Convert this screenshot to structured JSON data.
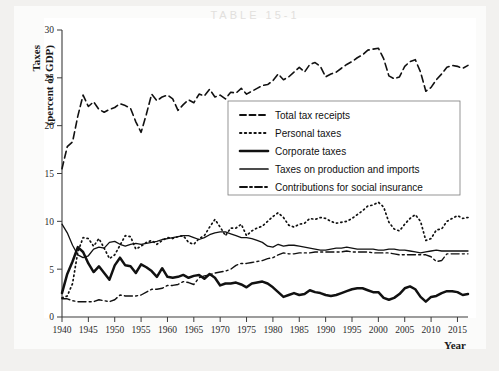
{
  "page": {
    "ghost_header": "TABLE 15-1"
  },
  "chart_data": {
    "type": "line",
    "title": "",
    "xlabel": "Year",
    "ylabel": "Taxes (percent of GDP)",
    "ylabel_line1": "Taxes",
    "ylabel_line2": "(percent of GDP)",
    "xlim": [
      1940,
      2017
    ],
    "ylim": [
      0,
      30
    ],
    "yticks": [
      0,
      5,
      10,
      15,
      20,
      25,
      30
    ],
    "ytick_labels": [
      "0",
      "5",
      "10",
      "15",
      "20",
      "25",
      "30"
    ],
    "xticks": [
      1940,
      1945,
      1950,
      1955,
      1960,
      1965,
      1970,
      1975,
      1980,
      1985,
      1990,
      1995,
      2000,
      2005,
      2010,
      2015
    ],
    "xtick_labels": [
      "1940",
      "1945",
      "1950",
      "1955",
      "1960",
      "1965",
      "1970",
      "1975",
      "1980",
      "1985",
      "1990",
      "1995",
      "2000",
      "2005",
      "2010",
      "2015"
    ],
    "grid": false,
    "legend_position": "center",
    "x": [
      1940,
      1941,
      1942,
      1943,
      1944,
      1945,
      1946,
      1947,
      1948,
      1949,
      1950,
      1951,
      1952,
      1953,
      1954,
      1955,
      1956,
      1957,
      1958,
      1959,
      1960,
      1961,
      1962,
      1963,
      1964,
      1965,
      1966,
      1967,
      1968,
      1969,
      1970,
      1971,
      1972,
      1973,
      1974,
      1975,
      1976,
      1977,
      1978,
      1979,
      1980,
      1981,
      1982,
      1983,
      1984,
      1985,
      1986,
      1987,
      1988,
      1989,
      1990,
      1991,
      1992,
      1993,
      1994,
      1995,
      1996,
      1997,
      1998,
      1999,
      2000,
      2001,
      2002,
      2003,
      2004,
      2005,
      2006,
      2007,
      2008,
      2009,
      2010,
      2011,
      2012,
      2013,
      2014,
      2015,
      2016,
      2017
    ],
    "series": [
      {
        "name": "Total tax receipts",
        "style": "dashed",
        "linewidth": 1.6,
        "color": "#111111",
        "values": [
          15.5,
          17.8,
          18.3,
          21.0,
          23.2,
          22.0,
          22.5,
          21.7,
          21.4,
          21.7,
          21.9,
          22.3,
          22.1,
          21.8,
          20.4,
          19.3,
          21.2,
          23.3,
          22.6,
          23.0,
          23.2,
          22.8,
          21.6,
          22.2,
          22.7,
          22.4,
          23.3,
          23.1,
          23.8,
          23.0,
          23.2,
          22.8,
          23.5,
          23.4,
          23.9,
          23.3,
          23.6,
          23.9,
          24.2,
          24.3,
          24.7,
          25.4,
          24.8,
          25.1,
          25.6,
          26.1,
          25.6,
          26.4,
          26.6,
          26.2,
          25.1,
          25.4,
          25.6,
          26.0,
          26.4,
          26.7,
          27.1,
          27.4,
          27.9,
          28.0,
          28.1,
          27.0,
          25.2,
          24.9,
          25.1,
          26.2,
          26.7,
          26.9,
          25.6,
          23.6,
          24.0,
          24.8,
          25.4,
          26.1,
          26.3,
          26.2,
          26.0,
          26.3
        ]
      },
      {
        "name": "Personal taxes",
        "style": "dotted",
        "linewidth": 1.7,
        "color": "#111111",
        "values": [
          2.0,
          2.2,
          3.5,
          6.8,
          8.3,
          8.2,
          7.4,
          8.2,
          7.2,
          6.1,
          6.5,
          7.5,
          8.5,
          8.4,
          7.1,
          7.4,
          7.8,
          8.0,
          7.6,
          8.0,
          8.3,
          8.2,
          8.4,
          8.5,
          7.8,
          7.6,
          8.2,
          8.5,
          9.4,
          10.2,
          9.4,
          8.5,
          9.3,
          9.3,
          9.7,
          8.5,
          9.0,
          9.3,
          9.5,
          10.0,
          10.5,
          10.9,
          10.4,
          9.6,
          9.4,
          9.7,
          9.8,
          10.3,
          10.2,
          10.4,
          10.3,
          10.0,
          9.8,
          9.9,
          10.0,
          10.3,
          10.7,
          11.1,
          11.6,
          11.7,
          12.0,
          11.5,
          9.9,
          9.2,
          9.0,
          9.7,
          10.3,
          10.7,
          10.0,
          8.0,
          8.2,
          9.1,
          9.2,
          10.0,
          10.3,
          10.6,
          10.3,
          10.4
        ]
      },
      {
        "name": "Corporate taxes",
        "style": "solid",
        "linewidth": 2.5,
        "color": "#111111",
        "values": [
          2.5,
          4.5,
          5.8,
          7.3,
          6.8,
          5.6,
          4.7,
          5.3,
          4.6,
          3.9,
          5.4,
          6.2,
          5.4,
          5.3,
          4.6,
          5.5,
          5.2,
          4.8,
          4.2,
          5.1,
          4.2,
          4.1,
          4.2,
          4.4,
          4.1,
          4.3,
          4.4,
          4.0,
          4.5,
          4.1,
          3.3,
          3.5,
          3.5,
          3.6,
          3.4,
          3.1,
          3.5,
          3.6,
          3.7,
          3.5,
          3.1,
          2.6,
          2.1,
          2.3,
          2.5,
          2.3,
          2.4,
          2.8,
          2.6,
          2.5,
          2.3,
          2.2,
          2.3,
          2.5,
          2.7,
          2.9,
          3.0,
          3.0,
          2.8,
          2.6,
          2.6,
          2.0,
          1.8,
          2.0,
          2.4,
          3.0,
          3.2,
          2.9,
          2.1,
          1.6,
          2.1,
          2.2,
          2.5,
          2.7,
          2.7,
          2.6,
          2.3,
          2.4
        ]
      },
      {
        "name": "Taxes on production and imports",
        "style": "solid",
        "linewidth": 1.3,
        "color": "#111111",
        "values": [
          9.7,
          8.8,
          7.5,
          6.5,
          6.2,
          6.4,
          7.1,
          7.3,
          7.2,
          7.8,
          7.9,
          7.6,
          7.4,
          7.6,
          7.7,
          7.6,
          7.7,
          7.8,
          7.9,
          8.1,
          8.2,
          8.3,
          8.4,
          8.5,
          8.5,
          8.3,
          8.1,
          8.3,
          8.6,
          8.8,
          8.9,
          8.9,
          8.7,
          8.5,
          8.3,
          8.3,
          8.2,
          8.0,
          7.8,
          7.4,
          7.3,
          7.6,
          7.4,
          7.5,
          7.5,
          7.4,
          7.3,
          7.2,
          7.1,
          7.0,
          7.0,
          7.1,
          7.2,
          7.2,
          7.3,
          7.2,
          7.1,
          7.1,
          7.1,
          7.1,
          7.0,
          7.0,
          7.1,
          7.1,
          7.0,
          7.0,
          6.9,
          6.8,
          6.7,
          6.8,
          6.9,
          7.0,
          6.9,
          6.9,
          6.9,
          6.9,
          6.9,
          6.9
        ]
      },
      {
        "name": "Contributions for social insurance",
        "style": "dashdot",
        "linewidth": 1.4,
        "color": "#111111",
        "values": [
          1.9,
          1.9,
          1.7,
          1.6,
          1.6,
          1.6,
          1.6,
          1.8,
          1.7,
          1.6,
          1.8,
          2.3,
          2.2,
          2.2,
          2.2,
          2.3,
          2.6,
          2.9,
          2.9,
          3.0,
          3.3,
          3.3,
          3.4,
          3.7,
          3.6,
          3.4,
          4.1,
          4.3,
          4.4,
          4.6,
          4.7,
          4.8,
          5.0,
          5.4,
          5.6,
          5.6,
          5.7,
          5.8,
          5.9,
          6.1,
          6.2,
          6.5,
          6.7,
          6.6,
          6.6,
          6.7,
          6.7,
          6.7,
          6.8,
          6.8,
          6.8,
          6.8,
          6.8,
          6.8,
          6.9,
          6.8,
          6.8,
          6.8,
          6.8,
          6.7,
          6.7,
          6.7,
          6.7,
          6.6,
          6.5,
          6.5,
          6.5,
          6.5,
          6.5,
          6.5,
          6.3,
          5.8,
          5.9,
          6.6,
          6.6,
          6.6,
          6.6,
          6.6
        ]
      }
    ]
  },
  "legend": {
    "items": [
      {
        "label": "Total tax receipts",
        "style": "dashed"
      },
      {
        "label": "Personal taxes",
        "style": "dotted"
      },
      {
        "label": "Corporate taxes",
        "style": "solid-thick"
      },
      {
        "label": "Taxes on production and imports",
        "style": "solid"
      },
      {
        "label": "Contributions for social insurance",
        "style": "dashdot"
      }
    ]
  }
}
